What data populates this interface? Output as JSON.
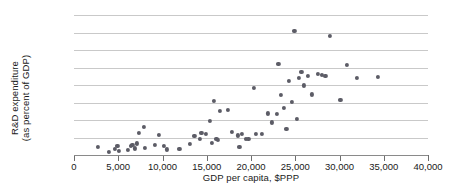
{
  "chart_data": {
    "type": "scatter",
    "title": "",
    "xlabel": "GDP per capita, $PPP",
    "ylabel": "R&D expenditure\n(as percent of GDP)",
    "ylabel_line1": "R&D expenditure",
    "ylabel_line2": "(as percent of GDP)",
    "xlim": [
      0,
      40000
    ],
    "ylim": [
      0,
      4
    ],
    "xticks": [
      0,
      5000,
      10000,
      15000,
      20000,
      25000,
      30000,
      35000,
      40000
    ],
    "xtick_labels": [
      "0",
      "5,000",
      "10,000",
      "15,000",
      "20,000",
      "25,000",
      "30,000",
      "35,000",
      "40,000"
    ],
    "yticks": [
      0,
      0.5,
      1,
      1.5,
      2,
      2.5,
      3,
      3.5,
      4
    ],
    "ytick_labels": [
      "0",
      "0.5",
      "1",
      "1.5",
      "2",
      "2.5",
      "3",
      "3.5",
      "4"
    ],
    "grid": "horizontal",
    "legend": "none",
    "marker_color": "#5c5c66",
    "gridline_color": "#c9c9c9",
    "axis_color": "#6e6e6e",
    "points": [
      [
        2700,
        0.22
      ],
      [
        3900,
        0.1
      ],
      [
        4600,
        0.17
      ],
      [
        4900,
        0.26
      ],
      [
        5100,
        0.12
      ],
      [
        6100,
        0.15
      ],
      [
        6400,
        0.26
      ],
      [
        6600,
        0.3
      ],
      [
        6900,
        0.19
      ],
      [
        7100,
        0.33
      ],
      [
        7300,
        0.62
      ],
      [
        7900,
        0.8
      ],
      [
        8000,
        0.2
      ],
      [
        9100,
        0.3
      ],
      [
        9600,
        0.58
      ],
      [
        10200,
        0.26
      ],
      [
        10500,
        0.16
      ],
      [
        11900,
        0.18
      ],
      [
        13100,
        0.32
      ],
      [
        13600,
        0.55
      ],
      [
        14200,
        0.45
      ],
      [
        14400,
        0.64
      ],
      [
        14900,
        0.61
      ],
      [
        15400,
        0.97
      ],
      [
        15600,
        0.34
      ],
      [
        15800,
        1.55
      ],
      [
        16100,
        0.46
      ],
      [
        16300,
        0.42
      ],
      [
        16500,
        1.26
      ],
      [
        17400,
        1.29
      ],
      [
        17800,
        0.66
      ],
      [
        18500,
        0.56
      ],
      [
        18700,
        0.24
      ],
      [
        19000,
        0.6
      ],
      [
        19400,
        0.45
      ],
      [
        19700,
        0.47
      ],
      [
        20300,
        1.92
      ],
      [
        20600,
        0.61
      ],
      [
        21200,
        0.6
      ],
      [
        21900,
        1.19
      ],
      [
        22400,
        0.93
      ],
      [
        22900,
        1.18
      ],
      [
        23100,
        2.6
      ],
      [
        23400,
        1.72
      ],
      [
        23700,
        1.34
      ],
      [
        24000,
        0.74
      ],
      [
        24300,
        2.12
      ],
      [
        24600,
        1.52
      ],
      [
        24900,
        3.55
      ],
      [
        25200,
        1.04
      ],
      [
        25400,
        2.2
      ],
      [
        25700,
        2.38
      ],
      [
        26000,
        1.99
      ],
      [
        26400,
        2.25
      ],
      [
        26900,
        1.73
      ],
      [
        27600,
        2.32
      ],
      [
        28000,
        2.29
      ],
      [
        28400,
        2.26
      ],
      [
        28900,
        3.4
      ],
      [
        30100,
        1.58
      ],
      [
        30800,
        2.58
      ],
      [
        32000,
        2.21
      ],
      [
        34300,
        2.22
      ]
    ]
  }
}
